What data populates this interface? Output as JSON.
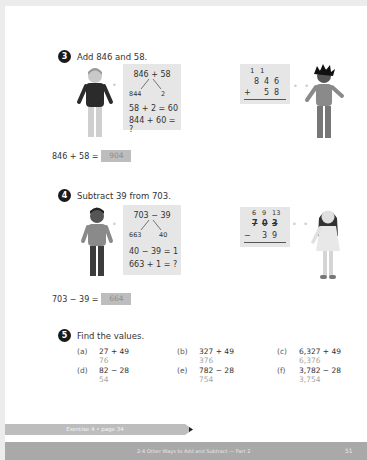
{
  "questions": [
    {
      "number": "3",
      "prompt": "Add 846 and 58.",
      "left_panel": {
        "top": "846 + 58",
        "split_left": "844",
        "split_right": "2",
        "line1": "58 + 2 = 60",
        "line2": "844 + 60 = ?"
      },
      "right_panel": {
        "carry": [
          "1",
          "1",
          ""
        ],
        "row1": [
          "8",
          "4",
          "6"
        ],
        "operator": "+",
        "row2": [
          "",
          "5",
          "8"
        ]
      },
      "answer_equation": "846 + 58 =",
      "answer_value": "904"
    },
    {
      "number": "4",
      "prompt": "Subtract 39 from 703.",
      "left_panel": {
        "top": "703 − 39",
        "split_left": "663",
        "split_right": "40",
        "line1": "40 − 39 = 1",
        "line2": "663 + 1 = ?"
      },
      "right_panel": {
        "regroup": [
          "6",
          "9",
          "13"
        ],
        "row1_crossed": [
          "7",
          "0",
          "3"
        ],
        "operator": "−",
        "row2": [
          "",
          "3",
          "9"
        ]
      },
      "answer_equation": "703 − 39 =",
      "answer_value": "664"
    }
  ],
  "q5": {
    "number": "5",
    "prompt": "Find the values.",
    "items": [
      {
        "label": "(a)",
        "expr": "27 + 49",
        "answer": "76"
      },
      {
        "label": "(b)",
        "expr": "327 + 49",
        "answer": "376"
      },
      {
        "label": "(c)",
        "expr": "6,327 + 49",
        "answer": "6,376"
      },
      {
        "label": "(d)",
        "expr": "82 − 28",
        "answer": "54"
      },
      {
        "label": "(e)",
        "expr": "782 − 28",
        "answer": "754"
      },
      {
        "label": "(f)",
        "expr": "3,782 − 28",
        "answer": "3,754"
      }
    ]
  },
  "exercise_bar": "Exercise 4 • page 34",
  "footer": {
    "lesson": "2-4 Other Ways to Add and Subtract — Part 2",
    "page_number": "51"
  },
  "colors": {
    "panel": "#e6e6e6",
    "answer_box": "#bdbdbd",
    "footer": "#a9a9a9",
    "answer_text": "#a5a5a5"
  }
}
